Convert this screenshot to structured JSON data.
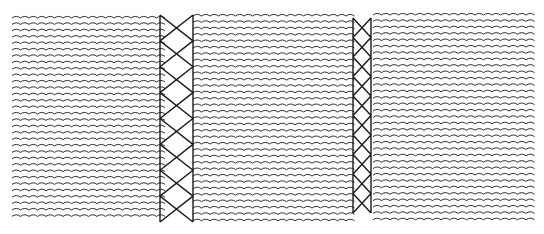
{
  "diagram": {
    "colors": {
      "ink": "#1a1a1a",
      "background": "#ffffff"
    },
    "panels": [
      {
        "name": "left-panel",
        "x": 12,
        "y": 16,
        "w": 148,
        "h": 204
      },
      {
        "name": "middle-panel",
        "x": 193,
        "y": 14,
        "w": 159,
        "h": 208
      },
      {
        "name": "right-panel",
        "x": 373,
        "y": 13,
        "w": 157,
        "h": 208
      }
    ],
    "bands": [
      {
        "name": "left-lattice-band",
        "x": 160,
        "y": 15,
        "w": 33,
        "h": 207,
        "cells": 8
      },
      {
        "name": "right-lattice-band",
        "x": 353,
        "y": 18,
        "w": 18,
        "h": 195,
        "cells": 10
      }
    ],
    "wave_spacing": 6.4
  }
}
